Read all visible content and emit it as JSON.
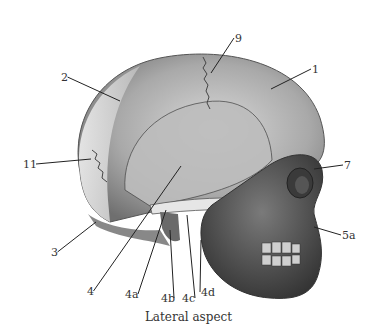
{
  "figure": {
    "caption": "Lateral aspect",
    "labels": [
      {
        "id": "1",
        "text": "1",
        "x": 312,
        "y": 64,
        "tx": 271,
        "ty": 89
      },
      {
        "id": "2",
        "text": "2",
        "x": 61,
        "y": 72,
        "tx": 120,
        "ty": 101
      },
      {
        "id": "3",
        "text": "3",
        "x": 51,
        "y": 247,
        "tx": 96,
        "ty": 222
      },
      {
        "id": "4",
        "text": "4",
        "x": 87,
        "y": 286,
        "tx": 181,
        "ty": 166
      },
      {
        "id": "4a",
        "text": "4a",
        "x": 125,
        "y": 289,
        "tx": 166,
        "ty": 210
      },
      {
        "id": "4b",
        "text": "4b",
        "x": 161,
        "y": 293,
        "tx": 170,
        "ty": 230
      },
      {
        "id": "4c",
        "text": "4c",
        "x": 182,
        "y": 293,
        "tx": 187,
        "ty": 215
      },
      {
        "id": "4d",
        "text": "4d",
        "x": 201,
        "y": 287,
        "tx": 201,
        "ty": 240
      },
      {
        "id": "5a",
        "text": "5a",
        "x": 342,
        "y": 230,
        "tx": 314,
        "ty": 227
      },
      {
        "id": "7",
        "text": "7",
        "x": 344,
        "y": 160,
        "tx": 314,
        "ty": 169
      },
      {
        "id": "9",
        "text": "9",
        "x": 235,
        "y": 33,
        "tx": 211,
        "ty": 73
      },
      {
        "id": "11",
        "text": "11",
        "x": 23,
        "y": 159,
        "tx": 91,
        "ty": 159
      }
    ]
  }
}
